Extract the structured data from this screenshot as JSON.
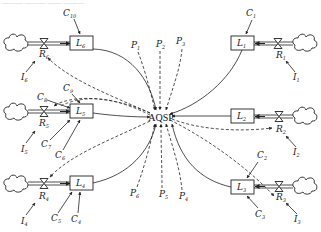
{
  "diagram": {
    "caption_partial": "——— ——— —— ———",
    "center": {
      "label": "AQSP"
    },
    "left_chains": [
      {
        "level": {
          "name": "L",
          "sub": "6"
        },
        "rate": {
          "name": "R",
          "sub": "6"
        },
        "input": {
          "name": "I",
          "sub": "6"
        },
        "constants": [
          {
            "name": "C",
            "sub": "10"
          }
        ]
      },
      {
        "level": {
          "name": "L",
          "sub": "5"
        },
        "rate": {
          "name": "R",
          "sub": "5"
        },
        "input": {
          "name": "I",
          "sub": "5"
        },
        "constants": [
          {
            "name": "C",
            "sub": "8"
          },
          {
            "name": "C",
            "sub": "9"
          },
          {
            "name": "C",
            "sub": "7"
          },
          {
            "name": "C",
            "sub": "6"
          }
        ]
      },
      {
        "level": {
          "name": "L",
          "sub": "4"
        },
        "rate": {
          "name": "R",
          "sub": "4"
        },
        "input": {
          "name": "I",
          "sub": "4"
        },
        "constants": [
          {
            "name": "C",
            "sub": "5"
          },
          {
            "name": "C",
            "sub": "4"
          }
        ]
      }
    ],
    "right_chains": [
      {
        "level": {
          "name": "L",
          "sub": "1"
        },
        "rate": {
          "name": "R",
          "sub": "1"
        },
        "input": {
          "name": "I",
          "sub": "1"
        },
        "constants": [
          {
            "name": "C",
            "sub": "1"
          }
        ]
      },
      {
        "level": {
          "name": "L",
          "sub": "2"
        },
        "rate": {
          "name": "R",
          "sub": "2"
        },
        "input": {
          "name": "I",
          "sub": "2"
        },
        "constants": []
      },
      {
        "level": {
          "name": "L",
          "sub": "3"
        },
        "rate": {
          "name": "R",
          "sub": "3"
        },
        "input": {
          "name": "I",
          "sub": "3"
        },
        "constants": [
          {
            "name": "C",
            "sub": "2"
          },
          {
            "name": "C",
            "sub": "3"
          }
        ]
      }
    ],
    "parameters_top": [
      {
        "name": "P",
        "sub": "1"
      },
      {
        "name": "P",
        "sub": "2"
      },
      {
        "name": "P",
        "sub": "3"
      }
    ],
    "parameters_bottom": [
      {
        "name": "P",
        "sub": "6"
      },
      {
        "name": "P",
        "sub": "5"
      },
      {
        "name": "P",
        "sub": "4"
      }
    ],
    "colors": {
      "stroke": "#222222",
      "background": "#ffffff"
    }
  }
}
